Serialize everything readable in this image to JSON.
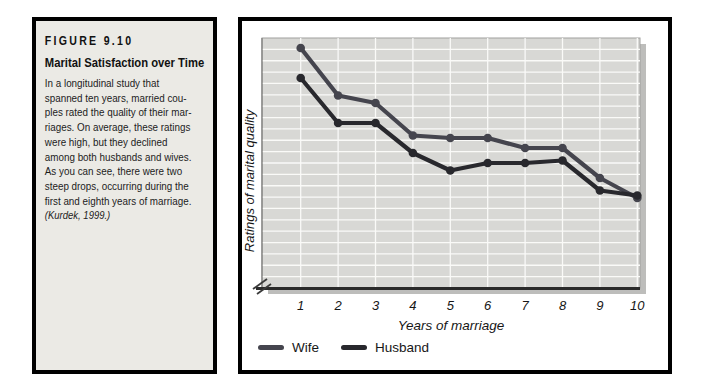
{
  "figure": {
    "label": "FIGURE 9.10",
    "title": "Marital Satisfaction over Time",
    "body_lines": [
      "In a longitudinal study that",
      "spanned ten years, married cou-",
      "ples rated the quality of their mar-",
      "riages. On average, these ratings",
      "were high, but they declined",
      "among both husbands and wives.",
      "As you can see, there were two",
      "steep drops, occurring during the",
      "first and eighth years of marriage.",
      "(Kurdek, 1999.)"
    ],
    "citation": "(Kurdek, 1999.)"
  },
  "chart": {
    "xlabel": "Years of marriage",
    "ylabel": "Ratings of marital quality"
  },
  "chart_data": {
    "type": "line",
    "x": [
      1,
      2,
      3,
      4,
      5,
      6,
      7,
      8,
      9,
      10
    ],
    "series": [
      {
        "name": "Wife",
        "color": "#45454e",
        "values": [
          96,
          77,
          74,
          61,
          60,
          60,
          56,
          56,
          44,
          36
        ]
      },
      {
        "name": "Husband",
        "color": "#28282d",
        "values": [
          84,
          66,
          66,
          54,
          47,
          50,
          50,
          51,
          39,
          37
        ]
      }
    ],
    "title": "Marital Satisfaction over Time",
    "xlabel": "Years of marriage",
    "ylabel": "Ratings of marital quality",
    "ylim": [
      0,
      100
    ],
    "grid": true,
    "legend_position": "bottom-left",
    "note": "Y axis shows no numeric labels (axis break at origin); values are relative rating height in % of axis."
  },
  "colors": {
    "panel_bg": "#ebeae5",
    "plot_bg": "#d8d8d5",
    "gridline": "#fafaf8",
    "shadow": "#bdbdbb",
    "border": "#000000",
    "axis_dark": "#2a2a2a"
  }
}
